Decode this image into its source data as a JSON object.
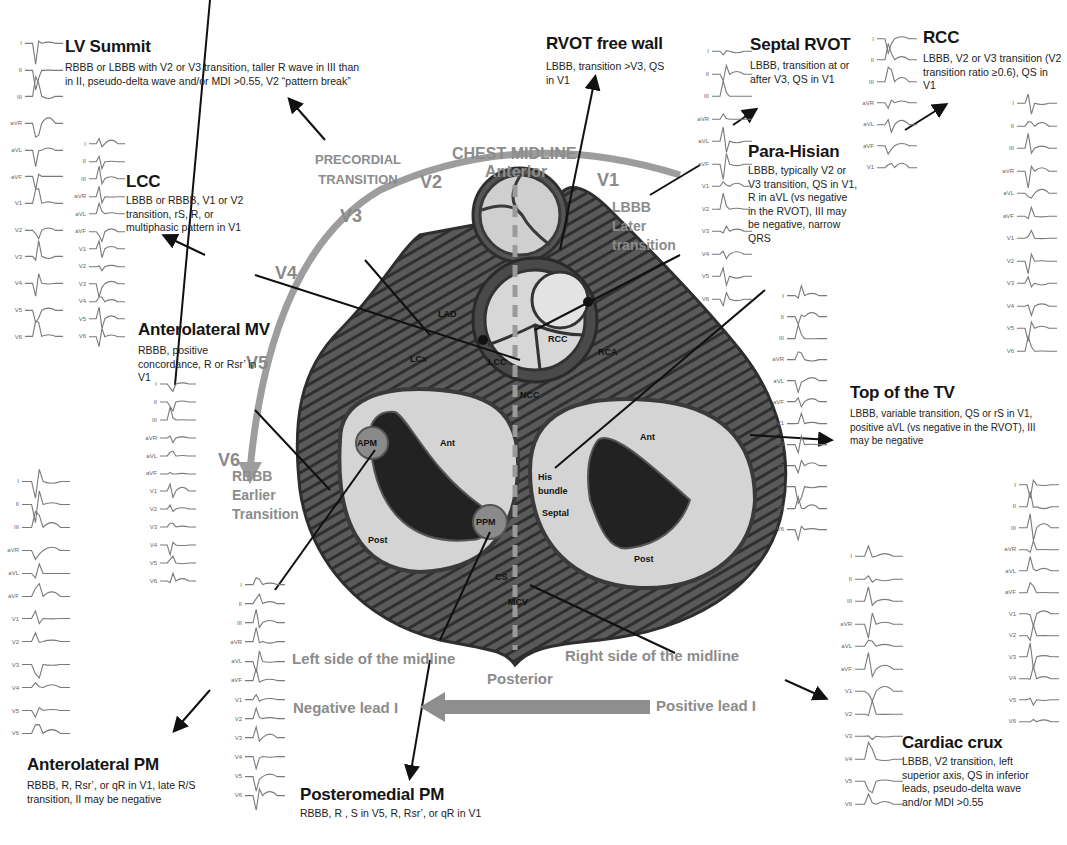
{
  "diagram": {
    "center_labels": {
      "chest_midline": "CHEST MIDLINE",
      "anterior": "Anterior",
      "posterior": "Posterior",
      "precordial_transition": "PRECORDIAL TRANSITION",
      "lbbb_block": [
        "LBBB",
        "Later",
        "transition"
      ],
      "rbbb_block": [
        "RBBB",
        "Earlier",
        "Transition"
      ],
      "left_side": "Left side of the midline",
      "right_side": "Right side of the midline",
      "negative_lead": "Negative lead I",
      "positive_lead": "Positive lead I"
    },
    "precordial_leads": [
      "V1",
      "V2",
      "V3",
      "V4",
      "V5",
      "V6"
    ],
    "heart_structures": [
      "LAD",
      "LCx",
      "LCC",
      "RCC",
      "NCC",
      "RCA",
      "APM",
      "PPM",
      "Ant",
      "Post",
      "His bundle",
      "Septal",
      "CS",
      "MCV",
      "Ant",
      "Post"
    ],
    "sites": [
      {
        "id": "lv-summit",
        "title": "LV Summit",
        "desc": "RBBB or LBBB with V2 or V3 transition, taller R wave in III than in II, pseudo-delta wave and/or MDI >0.55, V2 “pattern break”"
      },
      {
        "id": "rvot-free-wall",
        "title": "RVOT free wall",
        "desc": "LBBB, transition >V3, QS in V1"
      },
      {
        "id": "septal-rvot",
        "title": "Septal RVOT",
        "desc": "LBBB, transition at or after V3, QS in V1"
      },
      {
        "id": "rcc",
        "title": "RCC",
        "desc": "LBBB, V2 or V3 transition (V2 transition ratio ≥0.6), QS in V1"
      },
      {
        "id": "lcc",
        "title": "LCC",
        "desc": "LBBB or RBBB, V1 or V2 transition, rS, R, or multiphasic pattern in V1"
      },
      {
        "id": "para-hisian",
        "title": "Para-Hisian",
        "desc": "LBBB, typically V2 or V3 transition, QS in V1, R in aVL (vs negative in the RVOT), III may be negative, narrow QRS"
      },
      {
        "id": "anterolateral-mv",
        "title": "Anterolateral MV",
        "desc": "RBBB, positive concordance, R or Rsr’ in V1"
      },
      {
        "id": "top-of-tv",
        "title": "Top of the TV",
        "desc": "LBBB, variable transition, QS or rS in V1, positive aVL (vs negative in the RVOT), III may be negative"
      },
      {
        "id": "anterolateral-pm",
        "title": "Anterolateral PM",
        "desc": "RBBB, R, Rsr’, or qR in V1, late R/S transition, II may be negative"
      },
      {
        "id": "posteromedial-pm",
        "title": "Posteromedial PM",
        "desc": "RBBB, R , S in V5, R, Rsr’, or qR in V1"
      },
      {
        "id": "cardiac-crux",
        "title": "Cardiac crux",
        "desc": "LBBB, V2 transition, left superior axis, QS in inferior leads, pseudo-delta wave and/or MDI >0.55"
      }
    ],
    "ecg_lead_names": [
      "I",
      "II",
      "III",
      "aVR",
      "aVL",
      "aVF",
      "V1",
      "V2",
      "V3",
      "V4",
      "V5",
      "V6"
    ],
    "colors": {
      "arc": "#9a9a9a",
      "label_gray": "#8c8c8c",
      "heart_dark": "#3a3a3a",
      "heart_mid": "#6e6e6e",
      "heart_light": "#cfcfcf",
      "cavity": "#262626",
      "ecg_trace": "#7a7a7a"
    }
  }
}
